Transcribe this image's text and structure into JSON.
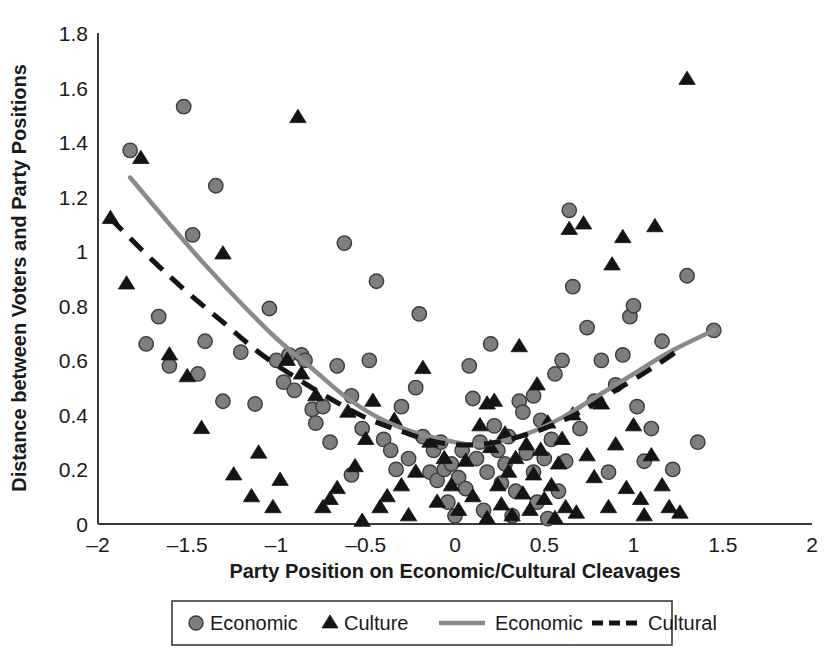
{
  "chart_data": {
    "type": "scatter",
    "title": "",
    "xlabel": "Party Position on Economic/Cultural Cleavages",
    "ylabel": "Distance between Voters and Party Positions",
    "xlim": [
      -2,
      2
    ],
    "ylim": [
      0,
      1.8
    ],
    "grid": false,
    "xticks": [
      -2,
      -1.5,
      -1,
      -0.5,
      0,
      0.5,
      1,
      1.5,
      2
    ],
    "xtick_labels": [
      "–2",
      "–1.5",
      "–1",
      "–0.5",
      "0",
      "0.5",
      "1",
      "1.5",
      "2"
    ],
    "yticks": [
      0,
      0.2,
      0.4,
      0.6,
      0.8,
      1,
      1.2,
      1.4,
      1.6,
      1.8
    ],
    "ytick_labels": [
      "0",
      "0.2",
      "0.4",
      "0.6",
      "0.8",
      "1",
      "1.2",
      "1.4",
      "1.6",
      "1.8"
    ],
    "legend_position": "bottom",
    "legend": [
      {
        "label": "Economic",
        "marker": "circle",
        "color": "#7e7e7e"
      },
      {
        "label": "Culture",
        "marker": "triangle",
        "color": "#141414"
      },
      {
        "label": "Economic",
        "marker": "solid-line",
        "color": "#8a8a8a"
      },
      {
        "label": "Cultural",
        "marker": "dashed-line",
        "color": "#141414"
      }
    ],
    "series": [
      {
        "name": "Economic",
        "marker": "circle",
        "color": "#7e7e7e",
        "points": [
          [
            -1.82,
            1.37
          ],
          [
            -1.73,
            0.66
          ],
          [
            -1.66,
            0.76
          ],
          [
            -1.6,
            0.58
          ],
          [
            -1.52,
            1.53
          ],
          [
            -1.47,
            1.06
          ],
          [
            -1.44,
            0.55
          ],
          [
            -1.4,
            0.67
          ],
          [
            -1.34,
            1.24
          ],
          [
            -1.3,
            0.45
          ],
          [
            -1.2,
            0.63
          ],
          [
            -1.12,
            0.44
          ],
          [
            -1.04,
            0.79
          ],
          [
            -1.0,
            0.6
          ],
          [
            -0.96,
            0.52
          ],
          [
            -0.93,
            0.62
          ],
          [
            -0.9,
            0.49
          ],
          [
            -0.86,
            0.62
          ],
          [
            -0.84,
            0.6
          ],
          [
            -0.8,
            0.42
          ],
          [
            -0.78,
            0.37
          ],
          [
            -0.74,
            0.43
          ],
          [
            -0.7,
            0.3
          ],
          [
            -0.66,
            0.58
          ],
          [
            -0.62,
            1.03
          ],
          [
            -0.58,
            0.47
          ],
          [
            -0.52,
            0.35
          ],
          [
            -0.48,
            0.6
          ],
          [
            -0.44,
            0.89
          ],
          [
            -0.4,
            0.31
          ],
          [
            -0.36,
            0.27
          ],
          [
            -0.33,
            0.2
          ],
          [
            -0.3,
            0.43
          ],
          [
            -0.26,
            0.24
          ],
          [
            -0.22,
            0.5
          ],
          [
            -0.2,
            0.77
          ],
          [
            -0.18,
            0.32
          ],
          [
            -0.14,
            0.19
          ],
          [
            -0.12,
            0.27
          ],
          [
            -0.1,
            0.16
          ],
          [
            -0.08,
            0.3
          ],
          [
            -0.06,
            0.2
          ],
          [
            -0.04,
            0.08
          ],
          [
            -0.02,
            0.22
          ],
          [
            0.0,
            0.03
          ],
          [
            0.02,
            0.17
          ],
          [
            0.04,
            0.27
          ],
          [
            0.06,
            0.13
          ],
          [
            0.08,
            0.58
          ],
          [
            0.1,
            0.46
          ],
          [
            0.12,
            0.24
          ],
          [
            0.14,
            0.3
          ],
          [
            0.16,
            0.05
          ],
          [
            0.18,
            0.19
          ],
          [
            0.2,
            0.66
          ],
          [
            0.22,
            0.36
          ],
          [
            0.24,
            0.27
          ],
          [
            0.26,
            0.15
          ],
          [
            0.28,
            0.22
          ],
          [
            0.3,
            0.32
          ],
          [
            0.32,
            0.03
          ],
          [
            0.34,
            0.12
          ],
          [
            0.36,
            0.45
          ],
          [
            0.38,
            0.41
          ],
          [
            0.4,
            0.26
          ],
          [
            0.44,
            0.19
          ],
          [
            0.46,
            0.08
          ],
          [
            0.48,
            0.38
          ],
          [
            0.5,
            0.24
          ],
          [
            0.52,
            0.02
          ],
          [
            0.54,
            0.31
          ],
          [
            0.56,
            0.55
          ],
          [
            0.58,
            0.12
          ],
          [
            0.6,
            0.6
          ],
          [
            0.62,
            0.23
          ],
          [
            0.64,
            1.15
          ],
          [
            0.66,
            0.87
          ],
          [
            0.7,
            0.35
          ],
          [
            0.74,
            0.72
          ],
          [
            0.78,
            0.45
          ],
          [
            0.82,
            0.6
          ],
          [
            0.86,
            0.19
          ],
          [
            0.9,
            0.51
          ],
          [
            0.94,
            0.62
          ],
          [
            0.98,
            0.76
          ],
          [
            1.0,
            0.8
          ],
          [
            1.02,
            0.43
          ],
          [
            1.06,
            0.23
          ],
          [
            1.1,
            0.35
          ],
          [
            1.16,
            0.67
          ],
          [
            1.22,
            0.2
          ],
          [
            1.3,
            0.91
          ],
          [
            1.36,
            0.3
          ],
          [
            1.45,
            0.71
          ],
          [
            -0.58,
            0.18
          ],
          [
            0.44,
            0.47
          ]
        ]
      },
      {
        "name": "Culture",
        "marker": "triangle",
        "color": "#141414",
        "points": [
          [
            -1.93,
            1.12
          ],
          [
            -1.84,
            0.88
          ],
          [
            -1.76,
            1.34
          ],
          [
            -1.6,
            0.62
          ],
          [
            -1.5,
            0.54
          ],
          [
            -1.42,
            0.35
          ],
          [
            -1.3,
            0.99
          ],
          [
            -1.24,
            0.18
          ],
          [
            -1.14,
            0.1
          ],
          [
            -1.1,
            0.26
          ],
          [
            -1.02,
            0.06
          ],
          [
            -0.98,
            0.16
          ],
          [
            -0.94,
            0.6
          ],
          [
            -0.88,
            1.49
          ],
          [
            -0.86,
            0.55
          ],
          [
            -0.78,
            0.47
          ],
          [
            -0.74,
            0.06
          ],
          [
            -0.7,
            0.09
          ],
          [
            -0.66,
            0.13
          ],
          [
            -0.6,
            0.41
          ],
          [
            -0.56,
            0.21
          ],
          [
            -0.5,
            0.31
          ],
          [
            -0.46,
            0.45
          ],
          [
            -0.42,
            0.06
          ],
          [
            -0.38,
            0.1
          ],
          [
            -0.34,
            0.38
          ],
          [
            -0.3,
            0.14
          ],
          [
            -0.26,
            0.03
          ],
          [
            -0.22,
            0.19
          ],
          [
            -0.18,
            0.57
          ],
          [
            -0.14,
            0.3
          ],
          [
            -0.1,
            0.08
          ],
          [
            -0.06,
            0.24
          ],
          [
            -0.02,
            0.14
          ],
          [
            0.02,
            0.05
          ],
          [
            0.06,
            0.23
          ],
          [
            0.1,
            0.1
          ],
          [
            0.14,
            0.36
          ],
          [
            0.18,
            0.02
          ],
          [
            0.2,
            0.28
          ],
          [
            0.22,
            0.45
          ],
          [
            0.24,
            0.14
          ],
          [
            0.26,
            0.07
          ],
          [
            0.28,
            0.33
          ],
          [
            0.3,
            0.19
          ],
          [
            0.32,
            0.03
          ],
          [
            0.34,
            0.24
          ],
          [
            0.36,
            0.65
          ],
          [
            0.38,
            0.11
          ],
          [
            0.4,
            0.29
          ],
          [
            0.42,
            0.05
          ],
          [
            0.44,
            0.18
          ],
          [
            0.46,
            0.51
          ],
          [
            0.48,
            0.27
          ],
          [
            0.5,
            0.09
          ],
          [
            0.52,
            0.37
          ],
          [
            0.54,
            0.14
          ],
          [
            0.56,
            0.02
          ],
          [
            0.58,
            0.22
          ],
          [
            0.6,
            0.31
          ],
          [
            0.62,
            0.06
          ],
          [
            0.64,
            1.08
          ],
          [
            0.68,
            0.04
          ],
          [
            0.72,
            1.1
          ],
          [
            0.74,
            0.25
          ],
          [
            0.78,
            0.17
          ],
          [
            0.82,
            0.44
          ],
          [
            0.86,
            0.06
          ],
          [
            0.88,
            0.95
          ],
          [
            0.9,
            0.29
          ],
          [
            0.94,
            1.05
          ],
          [
            0.96,
            0.13
          ],
          [
            1.0,
            0.36
          ],
          [
            1.04,
            0.09
          ],
          [
            1.06,
            0.03
          ],
          [
            1.1,
            0.25
          ],
          [
            1.12,
            1.09
          ],
          [
            1.16,
            0.14
          ],
          [
            1.2,
            0.06
          ],
          [
            1.26,
            0.04
          ],
          [
            1.3,
            1.63
          ],
          [
            -0.52,
            0.01
          ],
          [
            0.18,
            0.44
          ],
          [
            0.66,
            0.4
          ]
        ]
      }
    ],
    "fit_curves": [
      {
        "name": "Economic",
        "style": "solid",
        "color": "#8a8a8a",
        "points": [
          [
            -1.82,
            1.27
          ],
          [
            -1.6,
            1.1
          ],
          [
            -1.4,
            0.95
          ],
          [
            -1.2,
            0.81
          ],
          [
            -1.0,
            0.68
          ],
          [
            -0.8,
            0.57
          ],
          [
            -0.6,
            0.46
          ],
          [
            -0.4,
            0.38
          ],
          [
            -0.2,
            0.33
          ],
          [
            0.0,
            0.3
          ],
          [
            0.1,
            0.29
          ],
          [
            0.2,
            0.295
          ],
          [
            0.4,
            0.33
          ],
          [
            0.6,
            0.39
          ],
          [
            0.8,
            0.47
          ],
          [
            1.0,
            0.55
          ],
          [
            1.2,
            0.63
          ],
          [
            1.45,
            0.71
          ]
        ]
      },
      {
        "name": "Cultural",
        "style": "dashed",
        "color": "#141414",
        "points": [
          [
            -1.93,
            1.12
          ],
          [
            -1.7,
            0.97
          ],
          [
            -1.5,
            0.85
          ],
          [
            -1.3,
            0.74
          ],
          [
            -1.1,
            0.63
          ],
          [
            -0.9,
            0.54
          ],
          [
            -0.7,
            0.46
          ],
          [
            -0.5,
            0.39
          ],
          [
            -0.3,
            0.34
          ],
          [
            -0.1,
            0.3
          ],
          [
            0.1,
            0.29
          ],
          [
            0.3,
            0.31
          ],
          [
            0.5,
            0.35
          ],
          [
            0.7,
            0.41
          ],
          [
            0.9,
            0.49
          ],
          [
            1.1,
            0.57
          ],
          [
            1.28,
            0.65
          ]
        ]
      }
    ]
  }
}
